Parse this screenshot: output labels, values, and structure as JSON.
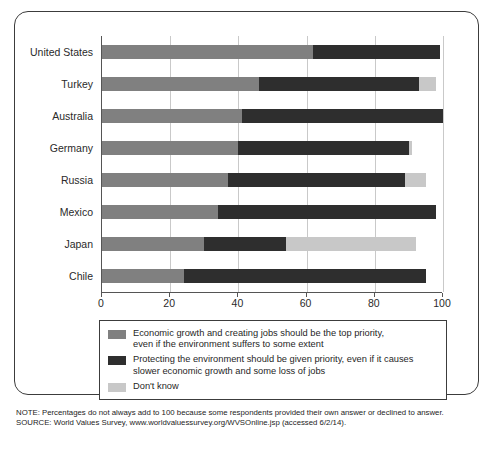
{
  "chart_data": {
    "type": "bar",
    "orientation": "horizontal",
    "stacked": true,
    "title": "",
    "xlabel": "",
    "ylabel": "",
    "xlim": [
      0,
      100
    ],
    "xticks": [
      0,
      20,
      40,
      60,
      80,
      100
    ],
    "grid": true,
    "legend_position": "bottom",
    "categories": [
      "United States",
      "Turkey",
      "Australia",
      "Germany",
      "Russia",
      "Mexico",
      "Japan",
      "Chile"
    ],
    "series": [
      {
        "name": "Economic growth and creating jobs should be the top priority, even if the environment suffers to some extent",
        "color": "#808080",
        "values": [
          62,
          46,
          41,
          40,
          37,
          34,
          30,
          24
        ]
      },
      {
        "name": "Protecting the environment should be given priority, even if it causes slower economic growth and some loss of jobs",
        "color": "#2e2e2e",
        "values": [
          37,
          47,
          59,
          50,
          52,
          64,
          24,
          71
        ]
      },
      {
        "name": "Don't know",
        "color": "#c8c8c8",
        "values": [
          0,
          5,
          0,
          1,
          6,
          0,
          38,
          0
        ]
      }
    ]
  },
  "legend": {
    "items": [
      {
        "color": "#808080",
        "line1": "Economic growth and creating jobs should be the top priority,",
        "line2": "even if the environment suffers to some extent"
      },
      {
        "color": "#2e2e2e",
        "line1": "Protecting the environment should be given priority, even if it causes",
        "line2": "slower economic growth and some loss of jobs"
      },
      {
        "color": "#c8c8c8",
        "line1": "Don't know",
        "line2": ""
      }
    ]
  },
  "notes": {
    "note": "NOTE: Percentages do not always add to 100 because some respondents provided their own answer or declined to answer.",
    "source": "SOURCE: World Values Survey, www.worldvaluessurvey.org/WVSOnline.jsp (accessed 6/2/14)."
  }
}
